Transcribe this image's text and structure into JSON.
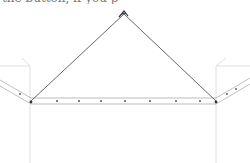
{
  "caption": {
    "text": "the button, if you                     p"
  },
  "illustration": {
    "description": "pencil sketch of a hanging bar with two angled side arms suspended by cords meeting at a hook",
    "apex": {
      "x": 124,
      "y": 14
    },
    "left_corner": {
      "x": 31,
      "y": 101
    },
    "right_corner": {
      "x": 216,
      "y": 101
    },
    "bar_dots_x": [
      57,
      79,
      101,
      125,
      150,
      176,
      200
    ],
    "colors": {
      "cord": "#555555",
      "bar_edge": "#b5b5b5",
      "dot": "#444444",
      "guide": "#d4d4d4"
    }
  }
}
